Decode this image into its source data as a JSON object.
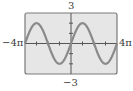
{
  "chart_data": {
    "type": "line",
    "title": "",
    "function": "y = 2 sin(x/2)",
    "xlabel": "",
    "ylabel": "",
    "xlim_labels": [
      "-4π",
      "4π"
    ],
    "ylim_labels": [
      "-3",
      "3"
    ],
    "xlim": [
      -12.566,
      12.566
    ],
    "ylim": [
      -3,
      3
    ],
    "x_tick_step": "π",
    "y_tick_step": 1,
    "grid": false,
    "legend": null,
    "series": [
      {
        "name": "sine curve",
        "x": [
          -12.566,
          -9.425,
          -6.283,
          -3.142,
          0,
          3.142,
          6.283,
          9.425,
          12.566
        ],
        "values": [
          0,
          2,
          0,
          -2,
          0,
          2,
          0,
          -2,
          0
        ]
      }
    ],
    "colors": {
      "background": "#e6e6e6",
      "frame": "#7a7a7a",
      "curve": "#8a8a8a",
      "axis": "#555555"
    }
  },
  "labels": {
    "top": "3",
    "bottom": "−3",
    "left": "−4π",
    "right": "4π"
  }
}
